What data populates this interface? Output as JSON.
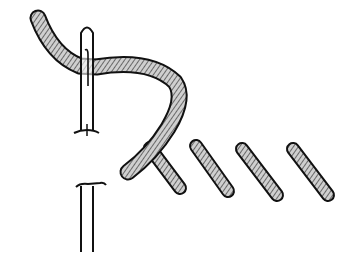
{
  "illustration": {
    "subject": "stem-stitch-embroidery-diagram",
    "colors": {
      "background": "#ffffff",
      "thread_fill": "#c9c9c9",
      "outline": "#111111",
      "needle_fill": "#ffffff"
    },
    "completed_stitch_count": 3
  }
}
